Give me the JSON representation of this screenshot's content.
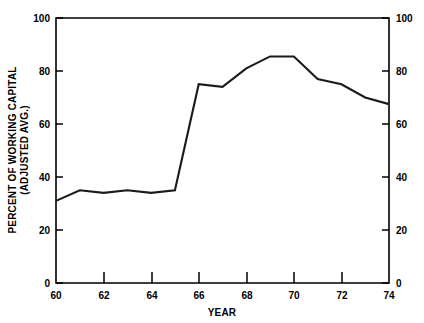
{
  "chart_data": {
    "type": "line",
    "title": "",
    "xlabel": "YEAR",
    "ylabel": "PERCENT OF WORKING CAPITAL (ADJUSTED AVG.)",
    "ylabel_line1": "PERCENT OF WORKING CAPITAL",
    "ylabel_line2": "(ADJUSTED AVG.)",
    "xlim": [
      60,
      74
    ],
    "ylim": [
      0,
      100
    ],
    "grid": false,
    "legend": "none",
    "x_tick_labels": [
      "60",
      "62",
      "64",
      "66",
      "68",
      "70",
      "72",
      "74"
    ],
    "x_tick_values": [
      60,
      62,
      64,
      66,
      68,
      70,
      72,
      74
    ],
    "x_minor_ticks": [
      61,
      63,
      65,
      67,
      69,
      71,
      73
    ],
    "y_tick_labels": [
      "0",
      "20",
      "40",
      "60",
      "80",
      "100"
    ],
    "y_tick_values": [
      0,
      20,
      40,
      60,
      80,
      100
    ],
    "right_axis_tick_labels": [
      "0",
      "20",
      "40",
      "60",
      "80",
      "100"
    ],
    "right_axis_tick_values": [
      0,
      20,
      40,
      60,
      80,
      100
    ],
    "x": [
      60,
      61,
      62,
      63,
      64,
      65,
      66,
      67,
      68,
      69,
      70,
      71,
      72,
      73,
      74
    ],
    "values": [
      31,
      35,
      34,
      35,
      34,
      35,
      75,
      74,
      81,
      85.5,
      85.5,
      77,
      75,
      70,
      67.5
    ],
    "series": [
      {
        "name": "Percent of working capital (adjusted avg.)",
        "color": "#1a1a1a",
        "values": [
          31,
          35,
          34,
          35,
          34,
          35,
          75,
          74,
          81,
          85.5,
          85.5,
          77,
          75,
          70,
          67.5
        ]
      }
    ]
  },
  "colors": {
    "line": "#1a1a1a",
    "axis": "#000000",
    "background": "#ffffff"
  }
}
